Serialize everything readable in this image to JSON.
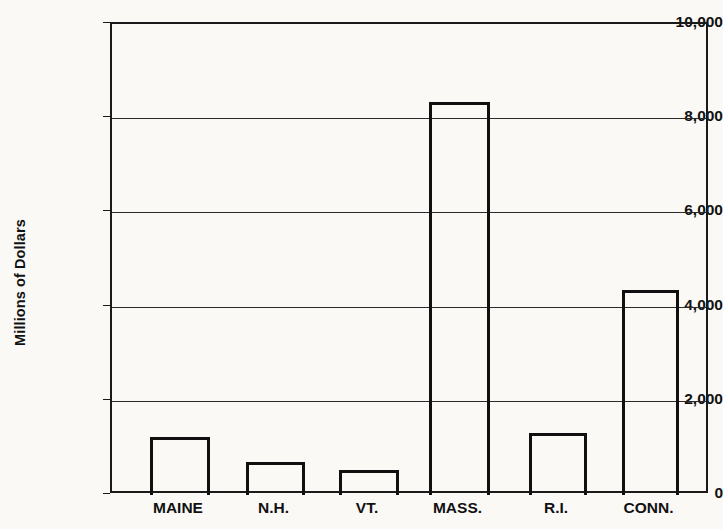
{
  "chart_data": {
    "type": "bar",
    "title": "",
    "subtitle": "",
    "xlabel": "",
    "ylabel": "Millions of Dollars",
    "categories": [
      "MAINE",
      "N.H.",
      "VT.",
      "MASS.",
      "R.I.",
      "CONN."
    ],
    "values": [
      1225,
      710,
      540,
      8350,
      1310,
      4350
    ],
    "ylim": [
      0,
      10000
    ],
    "ytick_values": [
      0,
      2000,
      4000,
      6000,
      8000,
      10000
    ],
    "ytick_labels": [
      "0",
      "2,000",
      "4,000",
      "6,000",
      "8,000",
      "10,000"
    ],
    "grid": true,
    "legend": null,
    "legend_position": "none",
    "annotations": [],
    "bar_style": {
      "fill": "none",
      "edge_color": "#101010",
      "edge_width": 3
    },
    "colors": {
      "background": "#faf9f6",
      "axis": "#1a1a1a",
      "gridline": "#2a2a2a",
      "text": "#111111"
    }
  },
  "layout": {
    "plot_left": 110,
    "plot_right": 708,
    "plot_top": 22,
    "plot_bottom": 493,
    "bars": [
      {
        "x": 148,
        "width": 60
      },
      {
        "x": 244,
        "width": 59
      },
      {
        "x": 337,
        "width": 60
      },
      {
        "x": 427,
        "width": 61
      },
      {
        "x": 527,
        "width": 58
      },
      {
        "x": 620,
        "width": 57
      }
    ],
    "category_label_y": 500
  }
}
